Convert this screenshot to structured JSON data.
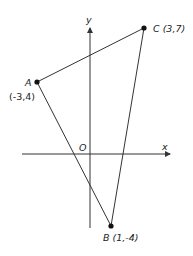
{
  "diagram": {
    "type": "coordinate-plane-triangle",
    "axes": {
      "x_label": "x",
      "y_label": "y",
      "origin_label": "O"
    },
    "points": [
      {
        "name": "A",
        "coord_label": "(-3,4)",
        "x": -3,
        "y": 4
      },
      {
        "name": "B",
        "coord_label": "(1,-4)",
        "x": 1,
        "y": -4
      },
      {
        "name": "C",
        "coord_label": "(3,7)",
        "x": 3,
        "y": 7
      }
    ],
    "labels": {
      "A_name": "A",
      "A_coord": "(-3,4)",
      "B_full": "B (1,-4)",
      "B_name": "B",
      "B_coord": "(1,-4)",
      "C_full": "C (3,7)"
    },
    "colors": {
      "line": "#333333",
      "point": "#111111",
      "background": "#ffffff"
    }
  }
}
